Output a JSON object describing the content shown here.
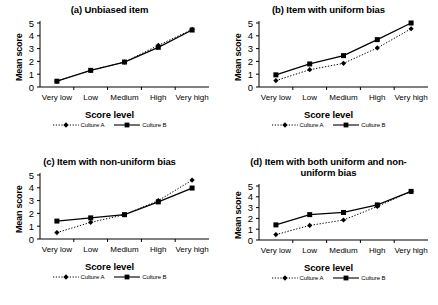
{
  "figure": {
    "x_axis_label": "Score level",
    "y_axis_label": "Mean score",
    "categories": [
      "Very low",
      "Low",
      "Medium",
      "High",
      "Very high"
    ],
    "y_ticks": [
      "0",
      "1",
      "2",
      "3",
      "4",
      "5"
    ],
    "ylim": [
      0,
      5
    ],
    "legend": [
      {
        "name": "Culture A",
        "style": "dotted",
        "marker": "diamond"
      },
      {
        "name": "Culture B",
        "style": "solid",
        "marker": "square"
      }
    ],
    "line_color": "#000000"
  },
  "panels": [
    {
      "id": "a",
      "title": "(a) Unbiased item",
      "title_lines": [
        "(a) Unbiased item"
      ]
    },
    {
      "id": "b",
      "title": "(b) Item with uniform bias",
      "title_lines": [
        "(b) Item with uniform bias"
      ]
    },
    {
      "id": "c",
      "title": "(c) Item with non-uniform bias",
      "title_lines": [
        "(c) Item with non-uniform bias"
      ]
    },
    {
      "id": "d",
      "title": "(d) Item with both uniform and non-uniform bias",
      "title_lines": [
        "(d) Item with both uniform and non-",
        "uniform bias"
      ]
    }
  ],
  "chart_data": [
    {
      "type": "line",
      "title": "(a) Unbiased item",
      "xlabel": "Score level",
      "ylabel": "Mean score",
      "categories": [
        "Very low",
        "Low",
        "Medium",
        "High",
        "Very high"
      ],
      "ylim": [
        0,
        5
      ],
      "grid": false,
      "legend_position": "bottom",
      "series": [
        {
          "name": "Culture A",
          "values": [
            0.45,
            1.3,
            1.95,
            3.25,
            4.5
          ]
        },
        {
          "name": "Culture B",
          "values": [
            0.45,
            1.3,
            1.95,
            3.1,
            4.45
          ]
        }
      ]
    },
    {
      "type": "line",
      "title": "(b) Item with uniform bias",
      "xlabel": "Score level",
      "ylabel": "Mean score",
      "categories": [
        "Very low",
        "Low",
        "Medium",
        "High",
        "Very high"
      ],
      "ylim": [
        0,
        5
      ],
      "grid": false,
      "legend_position": "bottom",
      "series": [
        {
          "name": "Culture A",
          "values": [
            0.5,
            1.35,
            1.85,
            3.05,
            4.55
          ]
        },
        {
          "name": "Culture B",
          "values": [
            0.95,
            1.8,
            2.45,
            3.7,
            5.0
          ]
        }
      ]
    },
    {
      "type": "line",
      "title": "(c) Item with non-uniform bias",
      "xlabel": "Score level",
      "ylabel": "Mean score",
      "categories": [
        "Very low",
        "Low",
        "Medium",
        "High",
        "Very high"
      ],
      "ylim": [
        0,
        5
      ],
      "grid": false,
      "legend_position": "bottom",
      "series": [
        {
          "name": "Culture A",
          "values": [
            0.5,
            1.3,
            1.9,
            3.0,
            4.6
          ]
        },
        {
          "name": "Culture B",
          "values": [
            1.4,
            1.65,
            1.9,
            2.9,
            3.98
          ]
        }
      ]
    },
    {
      "type": "line",
      "title": "(d) Item with both uniform and non-uniform bias",
      "xlabel": "Score level",
      "ylabel": "Mean score",
      "categories": [
        "Very low",
        "Low",
        "Medium",
        "High",
        "Very high"
      ],
      "ylim": [
        0,
        5
      ],
      "grid": false,
      "legend_position": "bottom",
      "series": [
        {
          "name": "Culture A",
          "values": [
            0.5,
            1.35,
            1.85,
            3.1,
            4.5
          ]
        },
        {
          "name": "Culture B",
          "values": [
            1.4,
            2.35,
            2.55,
            3.25,
            4.5
          ]
        }
      ]
    }
  ]
}
